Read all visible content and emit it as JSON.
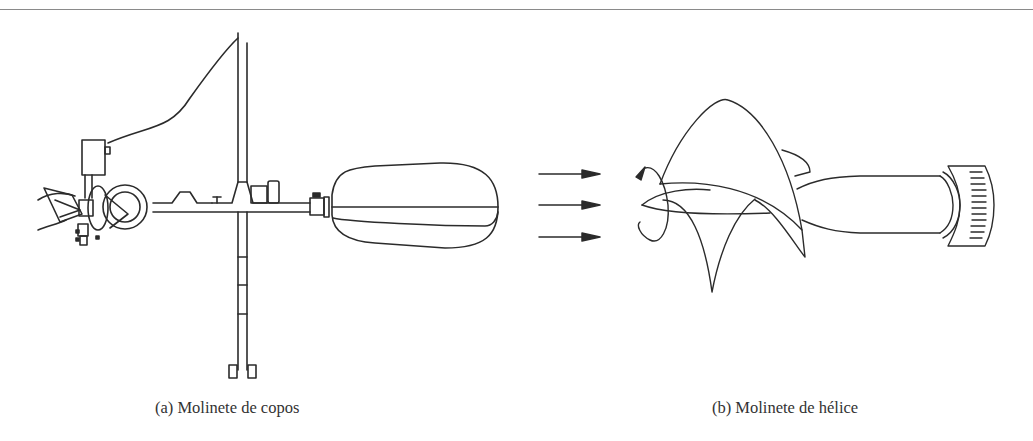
{
  "figure": {
    "panels": [
      {
        "id": "a",
        "caption": "(a) Molinete de copos",
        "illustration": "cup-type-current-meter-drawing"
      },
      {
        "id": "b",
        "caption": "(b) Molinete de hélice",
        "illustration": "propeller-type-current-meter-drawing"
      }
    ],
    "flow_arrows": {
      "count": 3,
      "direction": "right",
      "meaning": "water-flow-direction"
    },
    "colors": {
      "line": "#2b2b2b",
      "caption_text": "#333333",
      "rule": "#8a8a8a",
      "background": "#ffffff"
    }
  }
}
